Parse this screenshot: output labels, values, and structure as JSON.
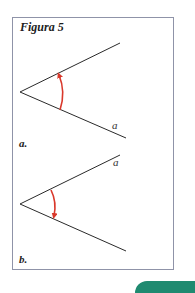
{
  "figure": {
    "title": "Figura 5",
    "panels": [
      {
        "label": "a.",
        "ray_label": "a",
        "ray_label_on": "lower ray",
        "arrow_direction": "counterclockwise (lower to upper)"
      },
      {
        "label": "b.",
        "ray_label": "a",
        "ray_label_on": "upper ray",
        "arrow_direction": "clockwise (upper to lower)"
      }
    ]
  },
  "colors": {
    "frame": "#8f93a8",
    "lines": "#2a2a2a",
    "arrow": "#d9382b",
    "accent_tab": "#1f8a70"
  }
}
